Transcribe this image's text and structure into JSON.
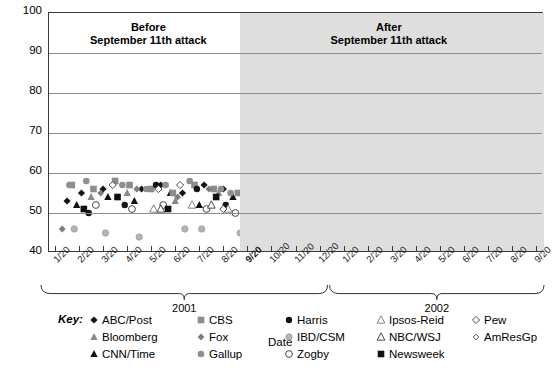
{
  "chart_data": {
    "type": "scatter",
    "title": "",
    "xlabel": "Date",
    "ylabel": "Approval rating",
    "ylim": [
      40,
      100
    ],
    "ytick_step": 10,
    "yticks": [
      "100",
      "90",
      "80",
      "70",
      "60",
      "50",
      "40"
    ],
    "grid": "horizontal",
    "legend_position": "below",
    "xticks": [
      "1/20",
      "2/20",
      "3/20",
      "4/20",
      "5/20",
      "6/20",
      "7/20",
      "8/20",
      "9/20",
      "10/20",
      "11/20",
      "12/20",
      "1/20",
      "2/20",
      "3/20",
      "4/20",
      "5/20",
      "6/20",
      "7/20",
      "8/20",
      "9/20"
    ],
    "xtick_bold_index": 8,
    "year_groups": [
      {
        "label": "2001",
        "start_index": 0,
        "end_index": 11
      },
      {
        "label": "2002",
        "start_index": 12,
        "end_index": 20
      }
    ],
    "shaded_region": {
      "label": "After September 11th attack",
      "start_tick_index": 8,
      "color": "#dedede"
    },
    "annotations": [
      {
        "line1": "Before",
        "line2": "September 11th attack"
      },
      {
        "line1": "After",
        "line2": "September 11th attack"
      }
    ],
    "series": [
      {
        "name": "ABC/Post",
        "marker": "diamond-filled-black",
        "color": "#1a1a1a",
        "points": [
          [
            0.5,
            53
          ],
          [
            1.1,
            55
          ],
          [
            2.0,
            56
          ],
          [
            3.6,
            56
          ],
          [
            4.4,
            57
          ],
          [
            5.3,
            55
          ],
          [
            6.2,
            57
          ],
          [
            7.0,
            56
          ],
          [
            7.9,
            57
          ],
          [
            8.05,
            92
          ],
          [
            8.3,
            90
          ],
          [
            8.6,
            88
          ],
          [
            8.9,
            89
          ],
          [
            9.2,
            87
          ],
          [
            9.6,
            86
          ],
          [
            10.1,
            86
          ],
          [
            10.6,
            84
          ],
          [
            11.2,
            84
          ],
          [
            11.8,
            83
          ],
          [
            12.4,
            82
          ],
          [
            13.0,
            81
          ],
          [
            13.6,
            80
          ],
          [
            14.2,
            78
          ],
          [
            14.9,
            77
          ],
          [
            15.5,
            75
          ],
          [
            16.2,
            77
          ],
          [
            16.9,
            73
          ],
          [
            17.5,
            71
          ],
          [
            18.2,
            70
          ],
          [
            18.9,
            68
          ],
          [
            19.5,
            67
          ],
          [
            20.0,
            66
          ]
        ]
      },
      {
        "name": "Bloomberg",
        "marker": "triangle-gray",
        "color": "#8a8a8a",
        "points": [
          [
            1.5,
            54
          ],
          [
            3.0,
            55
          ],
          [
            5.0,
            53
          ],
          [
            6.8,
            55
          ],
          [
            8.2,
            80
          ],
          [
            9.0,
            84
          ],
          [
            10.0,
            82
          ],
          [
            11.5,
            80
          ],
          [
            13.0,
            78
          ],
          [
            14.5,
            75
          ],
          [
            16.0,
            73
          ],
          [
            17.2,
            70
          ],
          [
            18.5,
            68
          ]
        ]
      },
      {
        "name": "CNN/Time",
        "marker": "triangle-black",
        "color": "#111111",
        "points": [
          [
            0.9,
            52
          ],
          [
            2.2,
            54
          ],
          [
            3.3,
            53
          ],
          [
            4.8,
            55
          ],
          [
            6.0,
            52
          ],
          [
            7.4,
            54
          ],
          [
            8.1,
            78
          ],
          [
            8.8,
            85
          ],
          [
            9.5,
            84
          ],
          [
            10.4,
            82
          ],
          [
            11.3,
            80
          ],
          [
            12.2,
            78
          ],
          [
            13.4,
            76
          ],
          [
            14.6,
            74
          ],
          [
            15.8,
            71
          ],
          [
            17.0,
            69
          ],
          [
            18.4,
            67
          ],
          [
            19.3,
            66
          ]
        ]
      },
      {
        "name": "CBS",
        "marker": "square-gray",
        "color": "#8c8c8c",
        "points": [
          [
            0.7,
            57
          ],
          [
            1.6,
            56
          ],
          [
            2.5,
            58
          ],
          [
            3.1,
            57
          ],
          [
            4.0,
            56
          ],
          [
            4.9,
            55
          ],
          [
            5.8,
            57
          ],
          [
            6.6,
            56
          ],
          [
            7.6,
            55
          ],
          [
            8.15,
            90
          ],
          [
            8.5,
            86
          ],
          [
            9.1,
            86
          ],
          [
            9.8,
            85
          ],
          [
            10.5,
            84
          ],
          [
            11.4,
            83
          ],
          [
            12.1,
            82
          ],
          [
            12.8,
            80
          ],
          [
            13.5,
            79
          ],
          [
            14.3,
            77
          ],
          [
            15.2,
            76
          ],
          [
            16.0,
            74
          ],
          [
            16.8,
            72
          ],
          [
            17.6,
            70
          ],
          [
            18.3,
            68
          ],
          [
            19.0,
            66
          ],
          [
            19.8,
            65
          ]
        ]
      },
      {
        "name": "Fox",
        "marker": "diamond-gray",
        "color": "#7d7d7d",
        "points": [
          [
            0.3,
            46
          ],
          [
            1.9,
            55
          ],
          [
            3.4,
            56
          ],
          [
            5.1,
            54
          ],
          [
            6.4,
            56
          ],
          [
            7.8,
            55
          ],
          [
            8.25,
            88
          ],
          [
            9.3,
            86
          ],
          [
            10.2,
            83
          ],
          [
            11.1,
            81
          ],
          [
            12.5,
            80
          ],
          [
            13.8,
            77
          ],
          [
            15.0,
            74
          ],
          [
            16.4,
            72
          ],
          [
            17.8,
            70
          ],
          [
            19.1,
            67
          ]
        ]
      },
      {
        "name": "Gallup",
        "marker": "circle-gray",
        "color": "#8f8f8f",
        "points": [
          [
            0.6,
            57
          ],
          [
            1.3,
            58
          ],
          [
            2.8,
            57
          ],
          [
            3.8,
            56
          ],
          [
            4.6,
            57
          ],
          [
            5.6,
            58
          ],
          [
            6.9,
            56
          ],
          [
            7.3,
            55
          ],
          [
            8.2,
            87
          ],
          [
            8.7,
            89
          ],
          [
            9.4,
            87
          ],
          [
            10.3,
            85
          ],
          [
            11.0,
            84
          ],
          [
            11.9,
            83
          ],
          [
            12.6,
            81
          ],
          [
            13.2,
            79
          ],
          [
            14.0,
            78
          ],
          [
            14.8,
            77
          ],
          [
            15.6,
            75
          ],
          [
            16.6,
            73
          ],
          [
            17.4,
            72
          ],
          [
            18.1,
            70
          ],
          [
            18.8,
            68
          ],
          [
            19.6,
            67
          ],
          [
            20.1,
            66
          ]
        ]
      },
      {
        "name": "Harris",
        "marker": "circle-black",
        "color": "#141414",
        "points": [
          [
            1.4,
            50
          ],
          [
            2.9,
            52
          ],
          [
            4.2,
            57
          ],
          [
            5.9,
            56
          ],
          [
            7.1,
            52
          ],
          [
            8.4,
            84
          ],
          [
            9.7,
            82
          ],
          [
            10.8,
            81
          ],
          [
            12.0,
            79
          ],
          [
            13.3,
            77
          ],
          [
            14.4,
            74
          ],
          [
            15.4,
            72
          ],
          [
            16.5,
            70
          ],
          [
            17.3,
            68
          ],
          [
            18.6,
            66
          ],
          [
            19.4,
            65
          ]
        ]
      },
      {
        "name": "IBD/CSM",
        "marker": "circle-lightgray",
        "color": "#b4b4b4",
        "points": [
          [
            0.8,
            46
          ],
          [
            2.1,
            45
          ],
          [
            3.5,
            44
          ],
          [
            5.4,
            46
          ],
          [
            6.1,
            46
          ],
          [
            7.7,
            45
          ],
          [
            9.9,
            72
          ],
          [
            11.6,
            68
          ],
          [
            13.1,
            66
          ],
          [
            14.7,
            65
          ],
          [
            16.1,
            62
          ],
          [
            17.7,
            60
          ],
          [
            19.2,
            58
          ]
        ]
      },
      {
        "name": "Zogby",
        "marker": "circle-open",
        "color": "#ffffff",
        "points": [
          [
            1.7,
            52
          ],
          [
            3.2,
            51
          ],
          [
            4.5,
            52
          ],
          [
            6.3,
            51
          ],
          [
            7.5,
            50
          ],
          [
            8.3,
            82
          ],
          [
            8.6,
            81
          ],
          [
            9.0,
            80
          ],
          [
            9.35,
            79
          ],
          [
            9.7,
            80
          ],
          [
            10.0,
            79
          ],
          [
            10.4,
            78
          ],
          [
            10.9,
            78
          ],
          [
            11.5,
            77
          ],
          [
            12.3,
            76
          ],
          [
            13.0,
            75
          ],
          [
            13.7,
            74
          ],
          [
            14.5,
            72
          ],
          [
            15.3,
            71
          ],
          [
            16.1,
            69
          ],
          [
            16.9,
            68
          ],
          [
            17.6,
            66
          ],
          [
            18.4,
            65
          ],
          [
            19.2,
            64
          ],
          [
            19.9,
            63
          ]
        ]
      },
      {
        "name": "Ipsos-Reid",
        "marker": "triangle-open-gray",
        "color": "#ffffff",
        "points": [
          [
            4.1,
            51
          ],
          [
            5.7,
            52
          ],
          [
            7.2,
            51
          ],
          [
            8.5,
            79
          ],
          [
            9.6,
            78
          ],
          [
            10.7,
            76
          ],
          [
            11.8,
            74
          ],
          [
            12.9,
            73
          ],
          [
            14.1,
            71
          ],
          [
            15.1,
            70
          ],
          [
            16.3,
            68
          ],
          [
            17.1,
            66
          ],
          [
            18.0,
            64
          ],
          [
            19.7,
            63
          ]
        ]
      },
      {
        "name": "NBC/WSJ",
        "marker": "triangle-open",
        "color": "#ffffff",
        "points": [
          [
            4.4,
            51
          ],
          [
            6.5,
            52
          ],
          [
            8.9,
            84
          ],
          [
            10.6,
            81
          ],
          [
            12.2,
            79
          ],
          [
            13.9,
            76
          ],
          [
            15.7,
            73
          ],
          [
            17.2,
            70
          ],
          [
            18.7,
            67
          ],
          [
            19.9,
            65
          ]
        ]
      },
      {
        "name": "Newsweek",
        "marker": "square-black",
        "color": "#0f0f0f",
        "points": [
          [
            1.2,
            51
          ],
          [
            2.6,
            54
          ],
          [
            4.7,
            51
          ],
          [
            6.7,
            54
          ],
          [
            8.2,
            85
          ],
          [
            9.2,
            85
          ],
          [
            10.1,
            84
          ],
          [
            11.2,
            83
          ],
          [
            12.4,
            81
          ],
          [
            13.6,
            79
          ],
          [
            14.9,
            76
          ],
          [
            15.9,
            74
          ],
          [
            16.7,
            71
          ],
          [
            17.9,
            68
          ],
          [
            19.0,
            65
          ],
          [
            19.7,
            64
          ]
        ]
      },
      {
        "name": "Pew",
        "marker": "diamond-open",
        "color": "#ffffff",
        "points": [
          [
            2.4,
            57
          ],
          [
            4.3,
            56
          ],
          [
            5.2,
            57
          ],
          [
            7.0,
            51
          ],
          [
            8.35,
            89
          ],
          [
            9.8,
            83
          ],
          [
            11.3,
            80
          ],
          [
            12.7,
            78
          ],
          [
            14.2,
            75
          ],
          [
            15.5,
            72
          ],
          [
            16.8,
            70
          ],
          [
            18.2,
            67
          ],
          [
            19.4,
            64
          ]
        ]
      },
      {
        "name": "AmResGp",
        "marker": "diamond-open-small",
        "color": "#ffffff",
        "points": [
          [
            8.6,
            71
          ],
          [
            10.5,
            62
          ],
          [
            13.4,
            65
          ],
          [
            15.0,
            60
          ],
          [
            16.5,
            58
          ],
          [
            18.9,
            56
          ],
          [
            20.0,
            54
          ]
        ]
      }
    ]
  },
  "axes": {
    "y_title": "Approval rating",
    "x_title": "Date"
  },
  "legend": {
    "key_label": "Key:",
    "columns": [
      [
        {
          "label": "ABC/Post",
          "marker": "diamond-filled-black"
        },
        {
          "label": "Bloomberg",
          "marker": "triangle-gray"
        },
        {
          "label": "CNN/Time",
          "marker": "triangle-black"
        }
      ],
      [
        {
          "label": "CBS",
          "marker": "square-gray"
        },
        {
          "label": "Fox",
          "marker": "diamond-gray"
        },
        {
          "label": "Gallup",
          "marker": "circle-gray"
        }
      ],
      [
        {
          "label": "Harris",
          "marker": "circle-black"
        },
        {
          "label": "IBD/CSM",
          "marker": "circle-lightgray"
        },
        {
          "label": "Zogby",
          "marker": "circle-open"
        }
      ],
      [
        {
          "label": "Ipsos-Reid",
          "marker": "triangle-open-gray"
        },
        {
          "label": "NBC/WSJ",
          "marker": "triangle-open"
        },
        {
          "label": "Newsweek",
          "marker": "square-black"
        }
      ],
      [
        {
          "label": "Pew",
          "marker": "diamond-open"
        },
        {
          "label": "AmResGp",
          "marker": "diamond-open-small"
        }
      ]
    ]
  },
  "colors": {
    "shade": "#dedede",
    "grid": "#8d8d8d",
    "frame": "#3a3a3a",
    "text": "#000000"
  }
}
